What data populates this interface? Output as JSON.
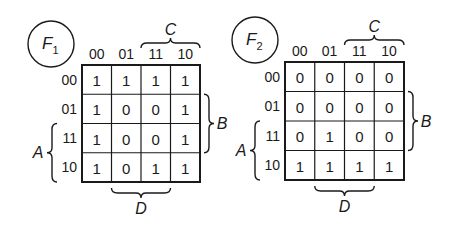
{
  "diagram": {
    "type": "karnaugh-maps",
    "maps": [
      {
        "name": "F",
        "subscript": "1",
        "column_variables_label": "CD",
        "row_variables_label": "AB",
        "column_headers": [
          "00",
          "01",
          "11",
          "10"
        ],
        "row_headers": [
          "00",
          "01",
          "11",
          "10"
        ],
        "cells": [
          [
            "1",
            "1",
            "1",
            "1"
          ],
          [
            "1",
            "0",
            "0",
            "1"
          ],
          [
            "1",
            "0",
            "0",
            "1"
          ],
          [
            "1",
            "0",
            "1",
            "1"
          ]
        ],
        "brace_labels": {
          "top": "C",
          "right": "B",
          "left": "A",
          "bottom": "D"
        }
      },
      {
        "name": "F",
        "subscript": "2",
        "column_variables_label": "CD",
        "row_variables_label": "AB",
        "column_headers": [
          "00",
          "01",
          "11",
          "10"
        ],
        "row_headers": [
          "00",
          "01",
          "11",
          "10"
        ],
        "cells": [
          [
            "0",
            "0",
            "0",
            "0"
          ],
          [
            "0",
            "0",
            "0",
            "0"
          ],
          [
            "0",
            "1",
            "0",
            "0"
          ],
          [
            "1",
            "1",
            "1",
            "1"
          ]
        ],
        "brace_labels": {
          "top": "C",
          "right": "B",
          "left": "A",
          "bottom": "D"
        }
      }
    ]
  }
}
